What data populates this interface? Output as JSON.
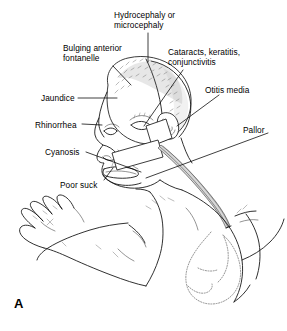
{
  "figure": {
    "letter": "A",
    "background_color": "#ffffff",
    "ink_color": "#000000"
  },
  "labels": [
    {
      "id": "hydrocephaly",
      "name": "label-hydrocephaly-microcephaly",
      "line1": "Hydrocephaly or",
      "line2": "microcephaly",
      "x": 114,
      "y": 10
    },
    {
      "id": "fontanelle",
      "name": "label-bulging-anterior-fontanelle",
      "line1": "Bulging anterior",
      "line2": "fontanelle",
      "x": 63,
      "y": 43
    },
    {
      "id": "cataracts",
      "name": "label-cataracts-keratitis-conjunctivitis",
      "line1": "Cataracts, keratitis,",
      "line2": "conjunctivitis",
      "x": 168,
      "y": 47
    },
    {
      "id": "otitis",
      "name": "label-otitis-media",
      "line1": "Otitis media",
      "line2": "",
      "x": 205,
      "y": 85
    },
    {
      "id": "jaundice",
      "name": "label-jaundice",
      "line1": "Jaundice",
      "line2": "",
      "x": 41,
      "y": 93
    },
    {
      "id": "rhinorrhea",
      "name": "label-rhinorrhea",
      "line1": "Rhinorrhea",
      "line2": "",
      "x": 35,
      "y": 120
    },
    {
      "id": "pallor",
      "name": "label-pallor",
      "line1": "Pallor",
      "line2": "",
      "x": 243,
      "y": 125
    },
    {
      "id": "cyanosis",
      "name": "label-cyanosis",
      "line1": "Cyanosis",
      "line2": "",
      "x": 45,
      "y": 147
    },
    {
      "id": "poorsuck",
      "name": "label-poor-suck",
      "line1": "Poor suck",
      "line2": "",
      "x": 60,
      "y": 180
    }
  ]
}
